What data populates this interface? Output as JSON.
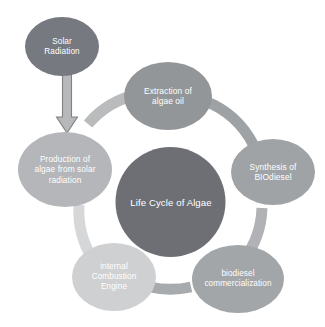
{
  "diagram": {
    "title": "Life Cycle of Algae",
    "center": {
      "label": "Life Cycle of Algae",
      "color": "#6d6f74"
    },
    "input_node": {
      "label": "Solar\nRadiation",
      "line1": "Solar",
      "line2": "Radiation",
      "color": "#76797f"
    },
    "arrow": {
      "name": "down-arrow",
      "direction": "down",
      "color": "#b6b8ba",
      "outline_color": "#7f8184"
    },
    "cycle_nodes": [
      {
        "id": "production",
        "line1": "Production of",
        "line2": "algae from solar",
        "line3": "radiation",
        "color": "#b4b6b9"
      },
      {
        "id": "extraction",
        "line1": "Extraction of",
        "line2": "algae oil",
        "line3": "",
        "color": "#939699"
      },
      {
        "id": "synthesis",
        "line1": "Synthesis of",
        "line2": "BIOdiesel",
        "line3": "",
        "color": "#a0a3a6"
      },
      {
        "id": "commercialization",
        "line1": "biodiesel",
        "line2": "commercialization",
        "line3": "",
        "color": "#a3a6a9"
      },
      {
        "id": "engine",
        "line1": "internal",
        "line2": "Combustion",
        "line3": "Engine",
        "color": "#cfd0d1"
      }
    ],
    "arcs": [
      {
        "id": "arc-production-extraction",
        "color": "#b9bbbd"
      },
      {
        "id": "arc-extraction-synthesis",
        "color": "#9fa2a5"
      },
      {
        "id": "arc-synthesis-commerc",
        "color": "#b0b2b5"
      },
      {
        "id": "arc-commerc-engine",
        "color": "#a8abae"
      },
      {
        "id": "arc-engine-production",
        "color": "#d6d7d8"
      }
    ],
    "background_color": "#ffffff"
  }
}
